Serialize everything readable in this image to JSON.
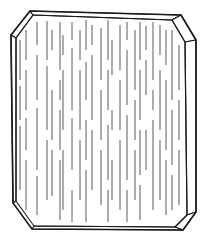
{
  "illustration": {
    "subject": "chamfered wafer tile with vertical grain streaks",
    "colors": {
      "background": "#ffffff",
      "outline": "#1a1a1a",
      "streak": "#5a5a5a"
    },
    "outer_outline": [
      [
        30,
        11
      ],
      [
        181,
        15
      ],
      [
        196,
        40
      ],
      [
        196,
        212
      ],
      [
        183,
        230
      ],
      [
        32,
        229
      ],
      [
        13,
        203
      ],
      [
        11,
        35
      ]
    ],
    "inner_outline": [
      [
        33,
        15
      ],
      [
        172,
        20
      ],
      [
        185,
        42
      ],
      [
        187,
        215
      ],
      [
        175,
        227
      ],
      [
        34,
        226
      ],
      [
        16,
        201
      ],
      [
        16,
        38
      ]
    ],
    "edge_faces": [
      {
        "name": "top-left-chamfer-face",
        "points": [
          [
            30,
            11
          ],
          [
            33,
            15
          ],
          [
            16,
            38
          ],
          [
            11,
            35
          ]
        ]
      },
      {
        "name": "top-edge-face",
        "points": [
          [
            30,
            11
          ],
          [
            181,
            15
          ],
          [
            172,
            20
          ],
          [
            33,
            15
          ]
        ]
      },
      {
        "name": "top-right-chamfer-face",
        "points": [
          [
            181,
            15
          ],
          [
            196,
            40
          ],
          [
            185,
            42
          ],
          [
            172,
            20
          ]
        ]
      },
      {
        "name": "right-edge-face",
        "points": [
          [
            196,
            40
          ],
          [
            196,
            212
          ],
          [
            187,
            215
          ],
          [
            185,
            42
          ]
        ]
      },
      {
        "name": "bottom-right-chamfer-face",
        "points": [
          [
            196,
            212
          ],
          [
            183,
            230
          ],
          [
            175,
            227
          ],
          [
            187,
            215
          ]
        ]
      },
      {
        "name": "bottom-edge-face",
        "points": [
          [
            183,
            230
          ],
          [
            32,
            229
          ],
          [
            34,
            226
          ],
          [
            175,
            227
          ]
        ]
      },
      {
        "name": "left-edge-face",
        "points": [
          [
            11,
            35
          ],
          [
            16,
            38
          ],
          [
            16,
            201
          ],
          [
            13,
            203
          ]
        ]
      }
    ],
    "streaks": [
      {
        "x": 20,
        "segments": [
          [
            40,
            80
          ],
          [
            86,
            120
          ],
          [
            126,
            190
          ]
        ]
      },
      {
        "x": 26,
        "segments": [
          [
            30,
            60
          ],
          [
            70,
            110
          ],
          [
            118,
            150
          ],
          [
            160,
            210
          ]
        ]
      },
      {
        "x": 37,
        "segments": [
          [
            22,
            45
          ],
          [
            55,
            100
          ],
          [
            108,
            170
          ],
          [
            176,
            215
          ]
        ]
      },
      {
        "x": 47,
        "segments": [
          [
            21,
            60
          ],
          [
            66,
            130
          ],
          [
            140,
            200
          ]
        ]
      },
      {
        "x": 52,
        "segments": [
          [
            30,
            50
          ],
          [
            90,
            140
          ],
          [
            150,
            196
          ]
        ]
      },
      {
        "x": 60,
        "segments": [
          [
            22,
            70
          ],
          [
            80,
            100
          ],
          [
            110,
            150
          ],
          [
            160,
            220
          ]
        ]
      },
      {
        "x": 63,
        "segments": [
          [
            35,
            55
          ],
          [
            70,
            130
          ],
          [
            150,
            210
          ]
        ]
      },
      {
        "x": 72,
        "segments": [
          [
            22,
            40
          ],
          [
            48,
            110
          ],
          [
            118,
            170
          ],
          [
            190,
            222
          ]
        ]
      },
      {
        "x": 80,
        "segments": [
          [
            30,
            60
          ],
          [
            70,
            130
          ],
          [
            140,
            200
          ]
        ]
      },
      {
        "x": 86,
        "segments": [
          [
            20,
            50
          ],
          [
            62,
            100
          ],
          [
            120,
            160
          ],
          [
            170,
            222
          ]
        ]
      },
      {
        "x": 92,
        "segments": [
          [
            25,
            45
          ],
          [
            55,
            120
          ],
          [
            130,
            190
          ]
        ]
      },
      {
        "x": 101,
        "segments": [
          [
            28,
            80
          ],
          [
            90,
            140
          ],
          [
            150,
            205
          ]
        ]
      },
      {
        "x": 108,
        "segments": [
          [
            20,
            60
          ],
          [
            70,
            110
          ],
          [
            125,
            180
          ],
          [
            190,
            222
          ]
        ]
      },
      {
        "x": 112,
        "segments": [
          [
            40,
            75
          ],
          [
            110,
            130
          ],
          [
            160,
            200
          ]
        ]
      },
      {
        "x": 120,
        "segments": [
          [
            25,
            70
          ],
          [
            80,
            130
          ],
          [
            140,
            210
          ]
        ]
      },
      {
        "x": 127,
        "segments": [
          [
            22,
            40
          ],
          [
            50,
            105
          ],
          [
            115,
            180
          ],
          [
            190,
            222
          ]
        ]
      },
      {
        "x": 135,
        "segments": [
          [
            30,
            90
          ],
          [
            100,
            140
          ],
          [
            150,
            200
          ]
        ]
      },
      {
        "x": 140,
        "segments": [
          [
            22,
            60
          ],
          [
            70,
            120
          ],
          [
            130,
            175
          ],
          [
            185,
            220
          ]
        ]
      },
      {
        "x": 146,
        "segments": [
          [
            26,
            50
          ],
          [
            60,
            95
          ],
          [
            130,
            170
          ]
        ]
      },
      {
        "x": 153,
        "segments": [
          [
            22,
            80
          ],
          [
            90,
            110
          ],
          [
            120,
            210
          ]
        ]
      },
      {
        "x": 160,
        "segments": [
          [
            25,
            55
          ],
          [
            70,
            130
          ],
          [
            140,
            200
          ]
        ]
      },
      {
        "x": 166,
        "segments": [
          [
            30,
            65
          ],
          [
            80,
            150
          ],
          [
            160,
            215
          ]
        ]
      },
      {
        "x": 172,
        "segments": [
          [
            30,
            100
          ],
          [
            110,
            165
          ],
          [
            175,
            210
          ]
        ]
      },
      {
        "x": 179,
        "segments": [
          [
            45,
            90
          ],
          [
            100,
            140
          ],
          [
            150,
            205
          ]
        ]
      }
    ]
  }
}
